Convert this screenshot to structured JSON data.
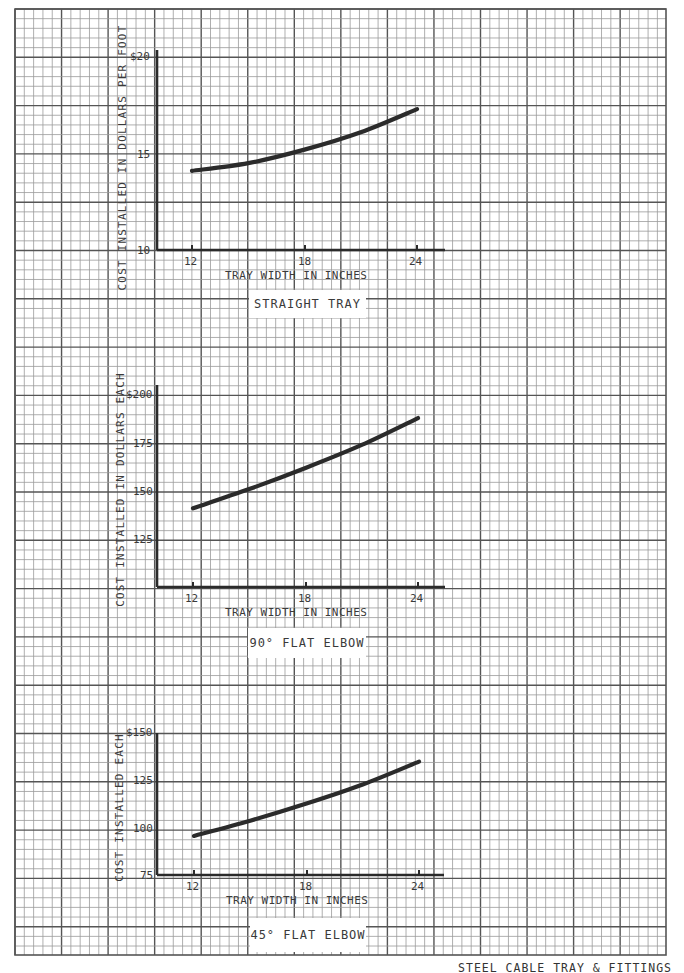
{
  "page": {
    "caption": "STEEL CABLE TRAY & FITTINGS",
    "grid": {
      "left": 15,
      "top": 9,
      "right": 666,
      "bottom": 955,
      "major_x": 46.55,
      "major_y": 48.3,
      "minor_per_major": 5,
      "minor_color": "#9a9a9a",
      "major_color": "#555555"
    },
    "ink_color": "#2b2b2b"
  },
  "chart_data": [
    {
      "type": "line",
      "title": "STRAIGHT TRAY",
      "xlabel": "TRAY WIDTH IN INCHES",
      "ylabel": "COST INSTALLED IN DOLLARS PER FOOT",
      "x_ticks": [
        "12",
        "18",
        "24"
      ],
      "y_ticks": [
        "10",
        "15",
        "$20"
      ],
      "ylim": [
        10,
        20
      ],
      "xlim": [
        10.5,
        25.5
      ],
      "grid": true,
      "series": [
        {
          "name": "Straight Tray",
          "x": [
            12,
            15,
            18,
            21,
            24
          ],
          "values": [
            14.1,
            14.5,
            15.2,
            16.1,
            17.3
          ]
        }
      ],
      "layout": {
        "axis_x0": 157,
        "axis_x1": 445,
        "axis_y": 250,
        "axis_ytop": 50,
        "x_px": {
          "12": 192,
          "18": 305,
          "24": 417
        },
        "y_px": {
          "min": 250,
          "max": 57
        },
        "ylabel_cx": 122,
        "ylabel_cy": 158,
        "xlabel_x": 224,
        "xlabel_y": 268,
        "title_box": [
          249,
          290,
          117,
          28
        ]
      }
    },
    {
      "type": "line",
      "title": "90° FLAT ELBOW",
      "xlabel": "TRAY WIDTH IN INCHES",
      "ylabel": "COST INSTALLED IN DOLLARS EACH",
      "x_ticks": [
        "12",
        "18",
        "24"
      ],
      "y_ticks": [
        "125",
        "150",
        "175",
        "$200"
      ],
      "ylim": [
        100,
        200
      ],
      "xlim": [
        10.5,
        25.5
      ],
      "grid": true,
      "series": [
        {
          "name": "90° Flat Elbow",
          "x": [
            12,
            15,
            18,
            21,
            24
          ],
          "values": [
            141,
            151,
            162,
            174,
            188
          ]
        }
      ],
      "layout": {
        "axis_x0": 157,
        "axis_x1": 445,
        "axis_y": 587,
        "axis_ytop": 385,
        "x_px": {
          "12": 193,
          "18": 306,
          "24": 418
        },
        "y_px": {
          "min": 587,
          "max": 395
        },
        "ylabel_cx": 120,
        "ylabel_cy": 490,
        "xlabel_x": 224,
        "xlabel_y": 605,
        "title_box": [
          248,
          627,
          118,
          30
        ]
      }
    },
    {
      "type": "line",
      "title": "45° FLAT ELBOW",
      "xlabel": "TRAY WIDTH IN INCHES",
      "ylabel": "COST INSTALLED EACH",
      "x_ticks": [
        "12",
        "18",
        "24"
      ],
      "y_ticks": [
        "75",
        "100",
        "125",
        "$150"
      ],
      "ylim": [
        75,
        150
      ],
      "xlim": [
        10.5,
        25.5
      ],
      "grid": true,
      "series": [
        {
          "name": "45° Flat Elbow",
          "x": [
            12,
            15,
            18,
            21,
            24
          ],
          "values": [
            96,
            104,
            113,
            123,
            135
          ]
        }
      ],
      "layout": {
        "axis_x0": 157,
        "axis_x1": 444,
        "axis_y": 875,
        "axis_ytop": 733,
        "x_px": {
          "12": 194,
          "18": 307,
          "24": 419
        },
        "y_px": {
          "min": 876,
          "max": 733
        },
        "ylabel_cx": 119,
        "ylabel_cy": 808,
        "xlabel_x": 226,
        "xlabel_y": 894,
        "title_box": [
          250,
          918,
          116,
          34
        ]
      }
    }
  ]
}
